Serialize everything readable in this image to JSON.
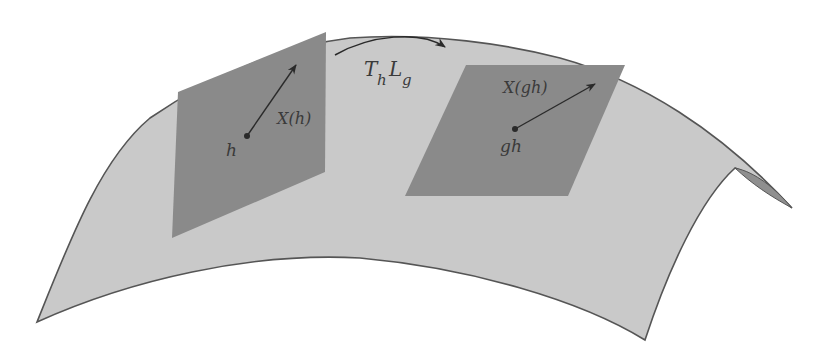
{
  "figure": {
    "surface": {
      "fill": "#c9c9c9",
      "edge": "#555555",
      "shadow_fill": "#9a9a9a"
    },
    "tangent_plane_color": "#8a8a8a",
    "left_plane": {
      "point_label": "h",
      "vector_label": "X(h)"
    },
    "right_plane": {
      "point_label": "gh",
      "vector_label": "X(gh)"
    },
    "map_arrow": {
      "label_main": "T",
      "label_sub": "h",
      "label_main2": "L",
      "label_sub2": "g"
    }
  }
}
